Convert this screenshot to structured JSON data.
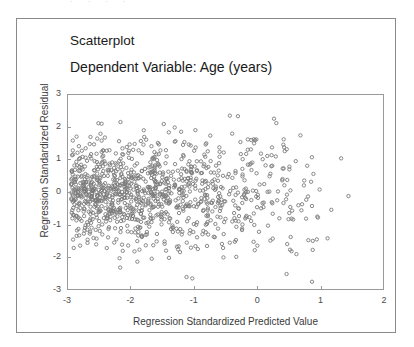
{
  "figure": {
    "scan_remnant": "· · · ·",
    "title": "Scatterplot",
    "subtitle": "Dependent Variable: Age (years)"
  },
  "chart_data": {
    "type": "scatter",
    "title": "Scatterplot",
    "subtitle": "Dependent Variable: Age (years)",
    "xlabel": "Regression Standardized Predicted Value",
    "ylabel": "Regression Standardized Residual",
    "xlim": [
      -3,
      2
    ],
    "ylim": [
      -3,
      3
    ],
    "xticks": [
      -3,
      -2,
      -1,
      0,
      1,
      2
    ],
    "xtick_labels": [
      "-3",
      "-2",
      "-1",
      "0",
      "1",
      "2"
    ],
    "yticks": [
      3,
      2,
      1,
      0,
      -1,
      -2,
      -3
    ],
    "ytick_labels": [
      "3",
      "2",
      "1",
      "0",
      "-1",
      "-2",
      "-3"
    ],
    "grid": false,
    "legend": false,
    "marker": {
      "shape": "open-circle",
      "color": "#7a7a7a",
      "size_px": 1.7
    },
    "n_points": 1100,
    "x_data_range": [
      -2.95,
      1.62
    ],
    "y_data_range": [
      -2.85,
      2.45
    ],
    "density_note": "Point density increases strongly toward the right; sparse at left. Residual spread is widest near x = 0 to 1.5.",
    "distribution": {
      "x_skew": "left-tailed, mass concentrated between 0.3 and 1.6",
      "y_center": 0.0,
      "y_spread": 1.0
    },
    "seed": 20240517
  },
  "axes": {
    "y_title": "Regression Standardized Residual",
    "x_title": "Regression Standardized Predicted Value"
  }
}
